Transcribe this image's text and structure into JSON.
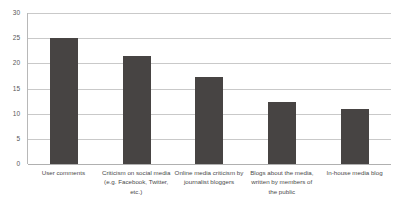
{
  "chart_data": {
    "type": "bar",
    "title": "",
    "subtitle": "",
    "xlabel": "",
    "ylabel": "",
    "categories": [
      "User comments",
      "Criticism on social media (e.g. Facebook, Twitter, etc.)",
      "Online media criticism by journalist bloggers",
      "Blogs about the media, written by members of the public",
      "In-house media blog"
    ],
    "values": [
      25.1,
      21.5,
      17.2,
      12.4,
      11.0
    ],
    "ylim": [
      0,
      30
    ],
    "yticks": [
      0,
      5,
      10,
      15,
      20,
      25,
      30
    ],
    "ytick_labels": [
      "0",
      "5",
      "10",
      "15",
      "20",
      "25",
      "30"
    ],
    "grid": true,
    "legend": "none",
    "bar_color": "#474443",
    "gridline_color": "#c9c9c9",
    "axis_color": "#b0b0b0",
    "background": "#ffffff"
  }
}
